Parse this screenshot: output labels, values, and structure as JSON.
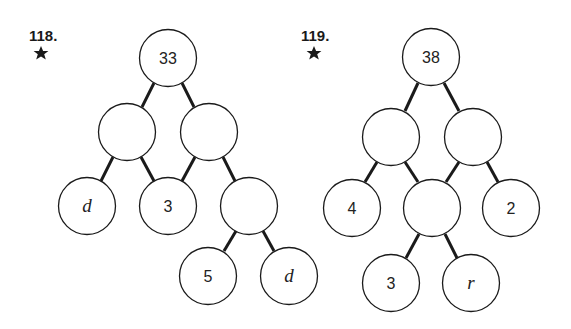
{
  "problems": [
    {
      "number": "118.",
      "marker": "star-icon",
      "nodes": [
        {
          "id": "a",
          "label": "33",
          "kind": "num",
          "x": 168,
          "y": 58
        },
        {
          "id": "b",
          "label": "",
          "kind": "num",
          "x": 127,
          "y": 132
        },
        {
          "id": "c",
          "label": "",
          "kind": "num",
          "x": 209,
          "y": 132
        },
        {
          "id": "d",
          "label": "d",
          "kind": "var",
          "x": 87,
          "y": 206
        },
        {
          "id": "e",
          "label": "3",
          "kind": "num",
          "x": 168,
          "y": 206
        },
        {
          "id": "f",
          "label": "",
          "kind": "num",
          "x": 249,
          "y": 206
        },
        {
          "id": "g",
          "label": "5",
          "kind": "num",
          "x": 208,
          "y": 276
        },
        {
          "id": "h",
          "label": "d",
          "kind": "var",
          "x": 289,
          "y": 276
        }
      ],
      "edges": [
        [
          "a",
          "b"
        ],
        [
          "a",
          "c"
        ],
        [
          "b",
          "d"
        ],
        [
          "b",
          "e"
        ],
        [
          "c",
          "e"
        ],
        [
          "c",
          "f"
        ],
        [
          "f",
          "g"
        ],
        [
          "f",
          "h"
        ]
      ]
    },
    {
      "number": "119.",
      "marker": "star-icon",
      "nodes": [
        {
          "id": "a",
          "label": "38",
          "kind": "num",
          "x": 431,
          "y": 57
        },
        {
          "id": "b",
          "label": "",
          "kind": "num",
          "x": 391,
          "y": 137
        },
        {
          "id": "c",
          "label": "",
          "kind": "num",
          "x": 473,
          "y": 137
        },
        {
          "id": "d",
          "label": "4",
          "kind": "num",
          "x": 352,
          "y": 208
        },
        {
          "id": "e",
          "label": "",
          "kind": "num",
          "x": 432,
          "y": 208
        },
        {
          "id": "f",
          "label": "2",
          "kind": "num",
          "x": 511,
          "y": 208
        },
        {
          "id": "g",
          "label": "3",
          "kind": "num",
          "x": 391,
          "y": 283
        },
        {
          "id": "h",
          "label": "r",
          "kind": "var",
          "x": 471,
          "y": 283
        }
      ],
      "edges": [
        [
          "a",
          "b"
        ],
        [
          "a",
          "c"
        ],
        [
          "b",
          "d"
        ],
        [
          "b",
          "e"
        ],
        [
          "c",
          "e"
        ],
        [
          "c",
          "f"
        ],
        [
          "e",
          "g"
        ],
        [
          "e",
          "h"
        ]
      ]
    }
  ]
}
